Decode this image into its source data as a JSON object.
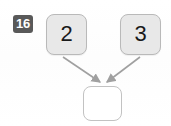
{
  "badge": {
    "label": "16"
  },
  "diagram": {
    "type": "addition-tree",
    "nodes": [
      {
        "id": "operand-left",
        "label": "2",
        "filled": true,
        "x": 46,
        "y": 14,
        "w": 41,
        "h": 41
      },
      {
        "id": "operand-right",
        "label": "3",
        "filled": true,
        "x": 120,
        "y": 14,
        "w": 41,
        "h": 41
      },
      {
        "id": "result",
        "label": "",
        "filled": false,
        "x": 83,
        "y": 86,
        "w": 39,
        "h": 35
      }
    ],
    "arrows": [
      {
        "id": "arrow-left-to-result",
        "from": "operand-left",
        "to": "result",
        "x1": 63,
        "y1": 57,
        "x2": 100,
        "y2": 83
      },
      {
        "id": "arrow-right-to-result",
        "from": "operand-right",
        "to": "result",
        "x1": 140,
        "y1": 57,
        "x2": 107,
        "y2": 83
      }
    ]
  },
  "colors": {
    "badge_bg": "#595959",
    "badge_text": "#ffffff",
    "node_fill": "#e8e8e8",
    "node_border": "#b9b9b9",
    "empty_node_fill": "#ffffff",
    "empty_node_border": "#c2c2c2",
    "arrow": "#a0a0a0",
    "text": "#1a1a1a",
    "background": "#ffffff"
  }
}
